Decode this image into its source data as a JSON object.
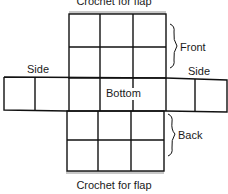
{
  "diagram": {
    "title_top": "Crochet for flap",
    "title_bottom": "Crochet for flap",
    "labels": {
      "side_left": "Side",
      "side_right": "Side",
      "bottom": "Bottom",
      "front": "Front",
      "back": "Back"
    },
    "colors": {
      "line": "#111111",
      "flap_shading": "#c8c8c8",
      "background": "#ffffff"
    },
    "panels": {
      "front": {
        "cols": [
          69,
          100,
          133,
          166
        ],
        "rows": [
          14,
          47,
          78
        ]
      },
      "center_row": {
        "cols": [
          4,
          35,
          69,
          100,
          133,
          166,
          195,
          227
        ],
        "rows_left": [
          77,
          110
        ],
        "rows_right": [
          80,
          112
        ]
      },
      "back": {
        "cols": [
          67,
          98,
          131,
          164
        ],
        "rows": [
          111,
          140,
          171
        ]
      }
    },
    "grid": {
      "front_cells": "3x2",
      "back_cells": "3x2",
      "side_cells_each": 2
    }
  }
}
